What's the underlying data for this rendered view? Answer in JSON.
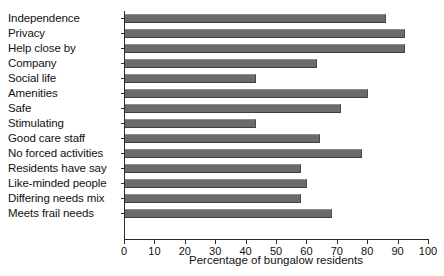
{
  "chart_data": {
    "type": "bar",
    "orientation": "horizontal",
    "title": "",
    "xlabel": "Percentage of bungalow residents",
    "ylabel": "",
    "xlim": [
      0,
      100
    ],
    "xticks": [
      0,
      10,
      20,
      30,
      40,
      50,
      60,
      70,
      80,
      90,
      100
    ],
    "grid": false,
    "legend": false,
    "bar_color": "#6b6b6b",
    "axis_color": "#2b2b2b",
    "categories": [
      "Independence",
      "Privacy",
      "Help close by",
      "Company",
      "Social life",
      "Amenities",
      "Safe",
      "Stimulating",
      "Good care staff",
      "No forced activities",
      "Residents have say",
      "Like-minded people",
      "Differing needs mix",
      "Meets frail needs"
    ],
    "values": [
      86,
      92,
      92,
      63,
      43,
      80,
      71,
      43,
      64,
      78,
      58,
      60,
      58,
      68
    ]
  }
}
